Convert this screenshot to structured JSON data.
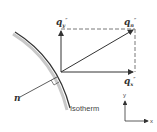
{
  "diagram": {
    "labels": {
      "qy": "q",
      "qy_sub": "y",
      "qn": "q",
      "qn_sub": "n",
      "qx": "q",
      "qx_sub": "x",
      "prime": "″",
      "normal": "n",
      "isotherm": "Isotherm",
      "axis_y": "y",
      "axis_x": "x"
    },
    "colors": {
      "stroke": "#333333",
      "shadow": "#bbbbbb",
      "dashed": "#555555"
    }
  }
}
